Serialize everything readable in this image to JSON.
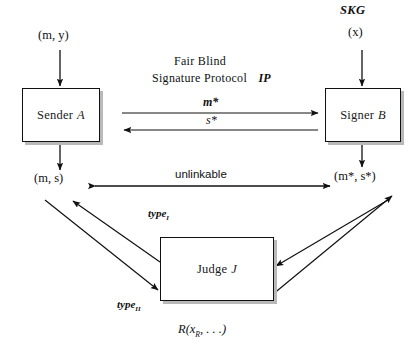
{
  "figure": {
    "kind": "protocol-flow-diagram",
    "title_block": {
      "line1": "Fair Blind",
      "line2_plain": "Signature Protocol",
      "line2_italic": "IP"
    },
    "nodes": [
      {
        "id": "sender",
        "name_plain": "Sender",
        "name_italic": "A",
        "x": 22,
        "y": 88,
        "w": 76,
        "h": 52
      },
      {
        "id": "signer",
        "name_plain": "Signer",
        "name_italic": "B",
        "x": 325,
        "y": 88,
        "w": 74,
        "h": 52
      },
      {
        "id": "judge",
        "name_plain": "Judge",
        "name_italic": "J",
        "x": 160,
        "y": 237,
        "w": 112,
        "h": 62
      }
    ],
    "labels": {
      "sender_input": "(m, y)",
      "sender_output": "(m, s)",
      "signer_key": "SKG",
      "signer_key_arg": "(x)",
      "signer_output": "(m*, s*)",
      "msg_forward": "m*",
      "msg_backward": "s*",
      "unlinkable": "unlinkable",
      "type_one": "type",
      "type_one_sub": "I",
      "type_two": "type",
      "type_two_sub": "II",
      "relation": "R(x",
      "relation_sub": "R",
      "relation_tail": ", . . .)"
    },
    "edges": [
      {
        "id": "in-sender",
        "from": "(m, y)",
        "to": "Sender A",
        "direction": "down",
        "arrow": "single"
      },
      {
        "id": "in-signer",
        "from": "SKG (x)",
        "to": "Signer B",
        "direction": "down",
        "arrow": "single"
      },
      {
        "id": "out-sender",
        "from": "Sender A",
        "to": "(m, s)",
        "direction": "down",
        "arrow": "single"
      },
      {
        "id": "out-signer",
        "from": "Signer B",
        "to": "(m*, s*)",
        "direction": "down",
        "arrow": "single"
      },
      {
        "id": "proto-forward",
        "from": "Sender A",
        "to": "Signer B",
        "direction": "right",
        "arrow": "single",
        "label": "m*"
      },
      {
        "id": "proto-back",
        "from": "Signer B",
        "to": "Sender A",
        "direction": "left",
        "arrow": "single",
        "label": "s*"
      },
      {
        "id": "unlinkable",
        "from": "(m, s)",
        "to": "(m*, s*)",
        "direction": "both",
        "arrow": "double",
        "label": "unlinkable"
      },
      {
        "id": "judge-left-up",
        "from": "Judge J",
        "to": "(m, s)",
        "direction": "up-left",
        "arrow": "single",
        "label": "type I"
      },
      {
        "id": "judge-left-dn",
        "from": "(m, s)",
        "to": "Judge J",
        "direction": "down-right",
        "arrow": "single",
        "label": "type II"
      },
      {
        "id": "judge-right-in",
        "from": "(m*, s*)",
        "to": "Judge J",
        "direction": "down-left",
        "arrow": "single"
      },
      {
        "id": "judge-right-out",
        "from": "Judge J",
        "to": "(m*, s*)",
        "direction": "up-right",
        "arrow": "single"
      }
    ],
    "colors": {
      "stroke": "#111111",
      "background": "#ffffff",
      "box_shadow": "#b9b9b9"
    }
  }
}
